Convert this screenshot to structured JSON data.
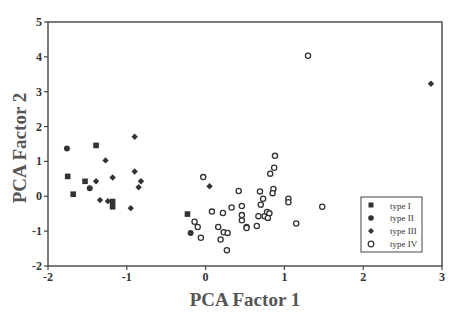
{
  "chart_data": {
    "type": "scatter",
    "title": "",
    "xlabel": "PCA Factor 1",
    "ylabel": "PCA Factor 2",
    "xlim": [
      -2,
      3
    ],
    "ylim": [
      -2,
      5
    ],
    "xticks": [
      -2,
      -1,
      0,
      1,
      2,
      3
    ],
    "yticks": [
      -2,
      -1,
      0,
      1,
      2,
      3,
      4,
      5
    ],
    "grid": false,
    "legend_position": "lower right",
    "series": [
      {
        "name": "type I",
        "marker": "square",
        "color": "#333333",
        "points": [
          [
            -1.39,
            1.46
          ],
          [
            -1.75,
            0.57
          ],
          [
            -1.53,
            0.43
          ],
          [
            -1.68,
            0.06
          ],
          [
            -1.18,
            -0.15
          ],
          [
            -1.18,
            -0.3
          ],
          [
            -0.23,
            -0.51
          ]
        ]
      },
      {
        "name": "type II",
        "marker": "circle-filled",
        "color": "#333333",
        "points": [
          [
            -1.76,
            1.37
          ],
          [
            -1.47,
            0.23
          ],
          [
            -0.19,
            -1.05
          ]
        ]
      },
      {
        "name": "type III",
        "marker": "diamond",
        "color": "#333333",
        "points": [
          [
            -0.9,
            1.71
          ],
          [
            -1.27,
            1.03
          ],
          [
            -0.9,
            0.71
          ],
          [
            -1.18,
            0.54
          ],
          [
            -1.39,
            0.43
          ],
          [
            -0.82,
            0.43
          ],
          [
            -0.85,
            0.26
          ],
          [
            -1.34,
            -0.11
          ],
          [
            -1.24,
            -0.14
          ],
          [
            -0.95,
            -0.34
          ],
          [
            0.05,
            0.29
          ],
          [
            2.86,
            3.23
          ]
        ]
      },
      {
        "name": "type IV",
        "marker": "circle-open",
        "color": "#333333",
        "points": [
          [
            1.3,
            4.03
          ],
          [
            0.88,
            1.16
          ],
          [
            0.87,
            0.82
          ],
          [
            0.82,
            0.65
          ],
          [
            -0.03,
            0.55
          ],
          [
            0.42,
            0.15
          ],
          [
            0.69,
            0.14
          ],
          [
            0.86,
            0.21
          ],
          [
            0.85,
            0.09
          ],
          [
            1.05,
            -0.07
          ],
          [
            1.05,
            -0.17
          ],
          [
            0.73,
            -0.07
          ],
          [
            0.7,
            -0.24
          ],
          [
            1.48,
            -0.3
          ],
          [
            0.08,
            -0.44
          ],
          [
            0.22,
            -0.48
          ],
          [
            0.33,
            -0.32
          ],
          [
            0.46,
            -0.28
          ],
          [
            0.46,
            -0.54
          ],
          [
            0.67,
            -0.57
          ],
          [
            0.75,
            -0.57
          ],
          [
            0.78,
            -0.45
          ],
          [
            0.81,
            -0.49
          ],
          [
            0.79,
            -0.62
          ],
          [
            -0.14,
            -0.73
          ],
          [
            0.46,
            -0.69
          ],
          [
            1.15,
            -0.78
          ],
          [
            0.52,
            -0.88
          ],
          [
            0.65,
            -0.85
          ],
          [
            0.52,
            -0.91
          ],
          [
            -0.1,
            -0.88
          ],
          [
            0.16,
            -0.88
          ],
          [
            0.23,
            -1.03
          ],
          [
            0.28,
            -1.05
          ],
          [
            -0.06,
            -1.19
          ],
          [
            0.19,
            -1.24
          ],
          [
            0.27,
            -1.55
          ]
        ]
      }
    ]
  }
}
